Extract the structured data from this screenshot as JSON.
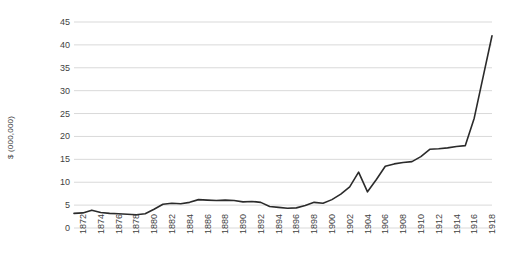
{
  "chart_data": {
    "type": "line",
    "title": "",
    "xlabel": "",
    "ylabel": "$ (000,000)",
    "ylim": [
      0,
      45
    ],
    "yticks": [
      0,
      5,
      10,
      15,
      20,
      25,
      30,
      35,
      40,
      45
    ],
    "ytick_labels": [
      "0",
      "5",
      "10",
      "15",
      "20",
      "25",
      "30",
      "35",
      "40",
      "45"
    ],
    "xlim": [
      1872,
      1919
    ],
    "xtick_labels": [
      "1872",
      "1874",
      "1876",
      "1878",
      "1880",
      "1882",
      "1884",
      "1886",
      "1888",
      "1890",
      "1892",
      "1894",
      "1896",
      "1898",
      "1900",
      "1902",
      "1904",
      "1906",
      "1908",
      "1910",
      "1912",
      "1914",
      "1916",
      "1918"
    ],
    "grid": "horizontal",
    "legend": "none",
    "line_color": "#2b2b2b",
    "grid_color": "#d9d9d9",
    "x": [
      1872,
      1873,
      1874,
      1875,
      1876,
      1877,
      1878,
      1879,
      1880,
      1881,
      1882,
      1883,
      1884,
      1885,
      1886,
      1887,
      1888,
      1889,
      1890,
      1891,
      1892,
      1893,
      1894,
      1895,
      1896,
      1897,
      1898,
      1899,
      1900,
      1901,
      1902,
      1903,
      1904,
      1905,
      1906,
      1907,
      1908,
      1909,
      1910,
      1911,
      1912,
      1913,
      1914,
      1915,
      1916,
      1917,
      1918,
      1919
    ],
    "values": [
      3.2,
      3.3,
      3.9,
      3.4,
      3.2,
      3.1,
      3.0,
      2.9,
      3.1,
      4.1,
      5.2,
      5.4,
      5.3,
      5.6,
      6.2,
      6.1,
      6.0,
      6.1,
      6.0,
      5.7,
      5.8,
      5.6,
      4.7,
      4.5,
      4.3,
      4.4,
      4.9,
      5.6,
      5.4,
      6.2,
      7.4,
      9.0,
      12.2,
      7.9,
      10.6,
      13.5,
      14.0,
      14.3,
      14.5,
      15.6,
      17.2,
      17.3,
      17.5,
      17.8,
      18.0,
      24.0,
      33.0,
      42.0
    ],
    "series_name": ""
  },
  "axes": {
    "plot_left": 74,
    "plot_right": 492,
    "plot_top": 22,
    "plot_bottom": 228
  }
}
